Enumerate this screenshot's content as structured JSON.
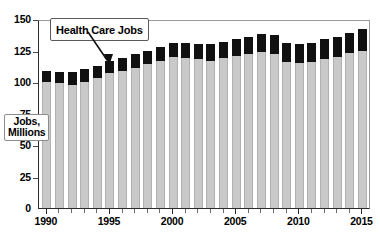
{
  "chart_data": {
    "type": "bar",
    "subtype": "stacked-bar",
    "title": "",
    "xlabel": "",
    "ylabel": "Jobs, Millions",
    "ylim": [
      0,
      150
    ],
    "ytick_values": [
      0,
      25,
      50,
      75,
      100,
      125,
      150
    ],
    "ytick_labels": [
      "0",
      "25",
      "50",
      "75",
      "100",
      "125",
      "150"
    ],
    "grid": false,
    "legend": "none",
    "annotations": [
      {
        "text": "Health Care Jobs",
        "points_to_year": 1994,
        "points_to_segment": "health_care"
      }
    ],
    "categories": [
      "1990",
      "1991",
      "1992",
      "1993",
      "1994",
      "1995",
      "1996",
      "1997",
      "1998",
      "1999",
      "2000",
      "2001",
      "2002",
      "2003",
      "2004",
      "2005",
      "2006",
      "2007",
      "2008",
      "2009",
      "2010",
      "2011",
      "2012",
      "2013",
      "2014",
      "2015"
    ],
    "xtick_labels": [
      "1990",
      "1995",
      "2000",
      "2005",
      "2010",
      "2015"
    ],
    "xtick_label_years": [
      1990,
      1995,
      2000,
      2005,
      2010,
      2015
    ],
    "series": [
      {
        "name": "Other Jobs",
        "color": "#c9c9c9",
        "values": [
          100,
          99,
          98,
          100,
          103,
          107,
          109,
          111,
          114,
          117,
          120,
          119,
          118,
          117,
          119,
          121,
          122,
          124,
          122,
          116,
          115,
          116,
          118,
          120,
          123,
          125
        ]
      },
      {
        "name": "Health Care Jobs",
        "color": "#111111",
        "values": [
          9,
          9,
          10,
          10,
          10,
          10,
          10,
          11,
          11,
          11,
          11,
          12,
          12,
          13,
          13,
          13,
          14,
          14,
          15,
          15,
          15,
          15,
          16,
          16,
          16,
          17
        ]
      }
    ],
    "totals": [
      109,
      108,
      108,
      110,
      113,
      117,
      119,
      122,
      125,
      128,
      131,
      131,
      130,
      130,
      132,
      134,
      136,
      138,
      137,
      131,
      130,
      131,
      134,
      136,
      139,
      142
    ]
  },
  "axis_title": {
    "line1": "Jobs,",
    "line2": "Millions"
  },
  "callout": {
    "label": "Health Care Jobs"
  }
}
